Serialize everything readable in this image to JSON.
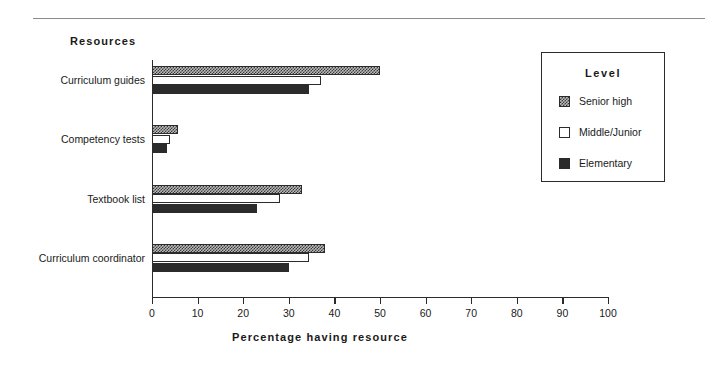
{
  "chart_data": {
    "type": "bar",
    "orientation": "horizontal",
    "title": "",
    "xlabel": "Percentage  having  resource",
    "ylabel": "Resources",
    "xlim": [
      0,
      100
    ],
    "xticks": [
      0,
      10,
      20,
      30,
      40,
      50,
      60,
      70,
      80,
      90,
      100
    ],
    "xtick_labels": [
      "0",
      "10",
      "20",
      "30",
      "40",
      "50",
      "60",
      "70",
      "80",
      "90",
      "100"
    ],
    "grid": false,
    "legend_position": "right",
    "legend_title": "Level",
    "categories": [
      "Curriculum guides",
      "Competency tests",
      "Textbook list",
      "Curriculum coordinator"
    ],
    "series": [
      {
        "name": "Senior high",
        "pattern": "checkered",
        "color": "#b8b8b8",
        "values": [
          50,
          5.7,
          33,
          38
        ]
      },
      {
        "name": "Middle/Junior",
        "pattern": "empty",
        "color": "#ffffff",
        "values": [
          37,
          4,
          28,
          34.5
        ]
      },
      {
        "name": "Elementary",
        "pattern": "solid",
        "color": "#2b2b2b",
        "values": [
          34.5,
          3.3,
          23,
          30
        ]
      }
    ]
  },
  "axes": {
    "y_title": "Resources",
    "x_title": "Percentage  having  resource"
  },
  "legend": {
    "title": "Level",
    "entries": [
      {
        "label": "Senior high",
        "swatch": "checkered-swatch"
      },
      {
        "label": "Middle/Junior",
        "swatch": "empty-swatch"
      },
      {
        "label": "Elementary",
        "swatch": "solid-swatch"
      }
    ]
  },
  "colors": {
    "axis": "#2b2b2b",
    "rule": "#8c8c8c",
    "senior_high": "#b8b8b8",
    "middle_junior": "#ffffff",
    "elementary": "#2b2b2b",
    "background": "#ffffff"
  }
}
